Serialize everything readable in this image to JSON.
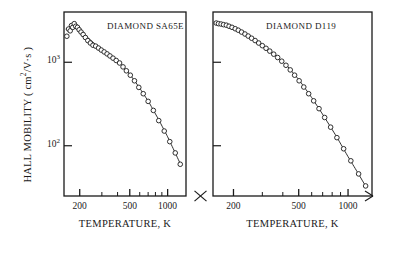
{
  "figure": {
    "ylabel_main": "HALL MOBILITY",
    "ylabel_units": "( cm",
    "ylabel_units_exp": "2",
    "ylabel_units_tail": "/V·s )",
    "xlabel": "TEMPERATURE, K",
    "ytick_labels": [
      {
        "mantissa": "10",
        "exp": "3",
        "value": 1000
      },
      {
        "mantissa": "10",
        "exp": "2",
        "value": 100
      }
    ],
    "xtick_labels": [
      "200",
      "500",
      "1000"
    ],
    "axis_break_marker": "x-break"
  },
  "chart_data": [
    {
      "type": "scatter",
      "title": "DIAMOND SA65E",
      "xlabel": "TEMPERATURE, K",
      "ylabel": "HALL MOBILITY ( cm2/V·s )",
      "xscale": "log",
      "yscale": "log",
      "xlim": [
        150,
        1400
      ],
      "ylim": [
        25,
        4000
      ],
      "xticks": [
        200,
        500,
        1000
      ],
      "yticks": [
        100,
        1000
      ],
      "grid": false,
      "legend": null,
      "marker": "open-circle",
      "points": [
        {
          "x": 158,
          "y": 2050
        },
        {
          "x": 163,
          "y": 2500
        },
        {
          "x": 168,
          "y": 2380
        },
        {
          "x": 172,
          "y": 2750
        },
        {
          "x": 176,
          "y": 2620
        },
        {
          "x": 181,
          "y": 2900
        },
        {
          "x": 186,
          "y": 2700
        },
        {
          "x": 192,
          "y": 2620
        },
        {
          "x": 198,
          "y": 2450
        },
        {
          "x": 205,
          "y": 2300
        },
        {
          "x": 213,
          "y": 2150
        },
        {
          "x": 222,
          "y": 1980
        },
        {
          "x": 232,
          "y": 1820
        },
        {
          "x": 243,
          "y": 1700
        },
        {
          "x": 255,
          "y": 1600
        },
        {
          "x": 268,
          "y": 1560
        },
        {
          "x": 282,
          "y": 1480
        },
        {
          "x": 297,
          "y": 1400
        },
        {
          "x": 313,
          "y": 1330
        },
        {
          "x": 330,
          "y": 1260
        },
        {
          "x": 348,
          "y": 1190
        },
        {
          "x": 368,
          "y": 1120
        },
        {
          "x": 390,
          "y": 1050
        },
        {
          "x": 415,
          "y": 980
        },
        {
          "x": 442,
          "y": 880
        },
        {
          "x": 470,
          "y": 790
        },
        {
          "x": 505,
          "y": 700
        },
        {
          "x": 545,
          "y": 600
        },
        {
          "x": 590,
          "y": 500
        },
        {
          "x": 640,
          "y": 420
        },
        {
          "x": 700,
          "y": 340
        },
        {
          "x": 770,
          "y": 265
        },
        {
          "x": 850,
          "y": 200
        },
        {
          "x": 940,
          "y": 150
        },
        {
          "x": 1040,
          "y": 112
        },
        {
          "x": 1150,
          "y": 82
        },
        {
          "x": 1260,
          "y": 60
        }
      ],
      "fit_curve": [
        {
          "x": 155,
          "y": 2500
        },
        {
          "x": 175,
          "y": 2700
        },
        {
          "x": 200,
          "y": 2430
        },
        {
          "x": 240,
          "y": 1880
        },
        {
          "x": 290,
          "y": 1470
        },
        {
          "x": 350,
          "y": 1190
        },
        {
          "x": 420,
          "y": 960
        },
        {
          "x": 500,
          "y": 720
        },
        {
          "x": 600,
          "y": 490
        },
        {
          "x": 720,
          "y": 320
        },
        {
          "x": 860,
          "y": 198
        },
        {
          "x": 1000,
          "y": 128
        },
        {
          "x": 1150,
          "y": 82
        },
        {
          "x": 1280,
          "y": 58
        }
      ]
    },
    {
      "type": "scatter",
      "title": "DIAMOND D119",
      "xlabel": "TEMPERATURE, K",
      "ylabel": "HALL MOBILITY ( cm2/V·s )",
      "xscale": "log",
      "yscale": "log",
      "xlim": [
        150,
        1400
      ],
      "ylim": [
        25,
        4000
      ],
      "xticks": [
        200,
        500,
        1000
      ],
      "yticks": [
        100,
        1000
      ],
      "grid": false,
      "legend": null,
      "marker": "open-circle",
      "points": [
        {
          "x": 157,
          "y": 2950
        },
        {
          "x": 162,
          "y": 2900
        },
        {
          "x": 168,
          "y": 2870
        },
        {
          "x": 174,
          "y": 2820
        },
        {
          "x": 181,
          "y": 2780
        },
        {
          "x": 188,
          "y": 2700
        },
        {
          "x": 196,
          "y": 2620
        },
        {
          "x": 205,
          "y": 2520
        },
        {
          "x": 214,
          "y": 2420
        },
        {
          "x": 224,
          "y": 2300
        },
        {
          "x": 235,
          "y": 2180
        },
        {
          "x": 246,
          "y": 2060
        },
        {
          "x": 258,
          "y": 1940
        },
        {
          "x": 271,
          "y": 1820
        },
        {
          "x": 285,
          "y": 1700
        },
        {
          "x": 300,
          "y": 1580
        },
        {
          "x": 316,
          "y": 1470
        },
        {
          "x": 333,
          "y": 1360
        },
        {
          "x": 352,
          "y": 1250
        },
        {
          "x": 372,
          "y": 1140
        },
        {
          "x": 394,
          "y": 1030
        },
        {
          "x": 418,
          "y": 920
        },
        {
          "x": 444,
          "y": 810
        },
        {
          "x": 472,
          "y": 700
        },
        {
          "x": 503,
          "y": 600
        },
        {
          "x": 537,
          "y": 505
        },
        {
          "x": 575,
          "y": 420
        },
        {
          "x": 617,
          "y": 345
        },
        {
          "x": 665,
          "y": 278
        },
        {
          "x": 720,
          "y": 218
        },
        {
          "x": 783,
          "y": 167
        },
        {
          "x": 855,
          "y": 125
        },
        {
          "x": 940,
          "y": 92
        },
        {
          "x": 1040,
          "y": 66
        },
        {
          "x": 1160,
          "y": 46
        },
        {
          "x": 1280,
          "y": 33
        }
      ],
      "fit_curve": [
        {
          "x": 155,
          "y": 2980
        },
        {
          "x": 180,
          "y": 2790
        },
        {
          "x": 210,
          "y": 2470
        },
        {
          "x": 250,
          "y": 2030
        },
        {
          "x": 300,
          "y": 1580
        },
        {
          "x": 360,
          "y": 1210
        },
        {
          "x": 430,
          "y": 880
        },
        {
          "x": 510,
          "y": 590
        },
        {
          "x": 610,
          "y": 360
        },
        {
          "x": 720,
          "y": 218
        },
        {
          "x": 860,
          "y": 124
        },
        {
          "x": 1000,
          "y": 74
        },
        {
          "x": 1150,
          "y": 47
        },
        {
          "x": 1290,
          "y": 32
        }
      ]
    }
  ]
}
